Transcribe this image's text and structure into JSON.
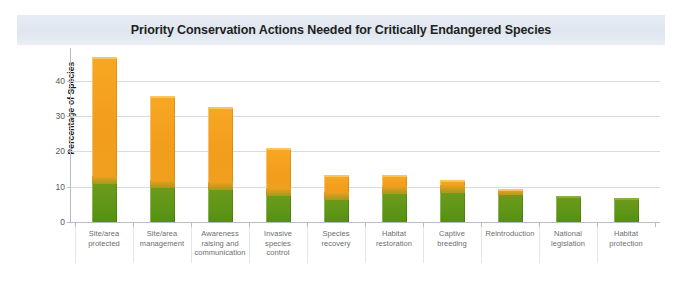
{
  "figure": {
    "title": "Priority Conservation Actions Needed for Critically Endangered Species",
    "background_color": "#ffffff",
    "title_banner_color": "#e3e9f2"
  },
  "chart_data": {
    "type": "bar",
    "stacked": true,
    "title": "Priority Conservation Actions Needed for Critically Endangered Species",
    "xlabel": "",
    "ylabel": "Percentage of Species",
    "ylim": [
      0,
      47
    ],
    "yticks": [
      0,
      10,
      20,
      30,
      40
    ],
    "ytick_labels": [
      "0",
      "10",
      "20",
      "30",
      "40"
    ],
    "grid": true,
    "legend": false,
    "categories": [
      "Site/area protected",
      "Site/area management",
      "Awareness raising and communication",
      "Invasive species control",
      "Species recovery",
      "Habitat restoration",
      "Captive breeding",
      "Reintroduction",
      "National legislation",
      "Habitat protection"
    ],
    "values": [
      46.7,
      35.7,
      32.6,
      21.0,
      13.3,
      13.3,
      11.9,
      9.3,
      7.4,
      6.8
    ],
    "series": [
      {
        "name": "Lower segment",
        "color": "#5e9617",
        "values": [
          10.8,
          9.5,
          9.0,
          7.4,
          6.2,
          8.0,
          8.3,
          7.6,
          7.4,
          6.8
        ]
      },
      {
        "name": "Upper segment",
        "color": "#f2a01e",
        "values": [
          35.9,
          26.2,
          23.6,
          13.6,
          7.1,
          5.3,
          3.6,
          1.7,
          0.0,
          0.0
        ]
      }
    ],
    "colors": {
      "orange": "#f2a01e",
      "green": "#5e9617",
      "gridline": "#d8dadd",
      "axis": "#b9bcc0",
      "tick_text": "#58595b",
      "label_text": "#6d6e71"
    }
  },
  "axis": {
    "y_title": "Percentage of Species",
    "y_ticks": [
      "40",
      "30",
      "20",
      "10",
      "0"
    ],
    "x_labels": [
      "Site/area\nprotected",
      "Site/area\nmanagement",
      "Awareness\nraising and\ncommunication",
      "Invasive\nspecies\ncontrol",
      "Species\nrecovery",
      "Habitat\nrestoration",
      "Captive\nbreeding",
      "Reintroduction",
      "National\nlegislation",
      "Habitat\nprotection"
    ]
  }
}
